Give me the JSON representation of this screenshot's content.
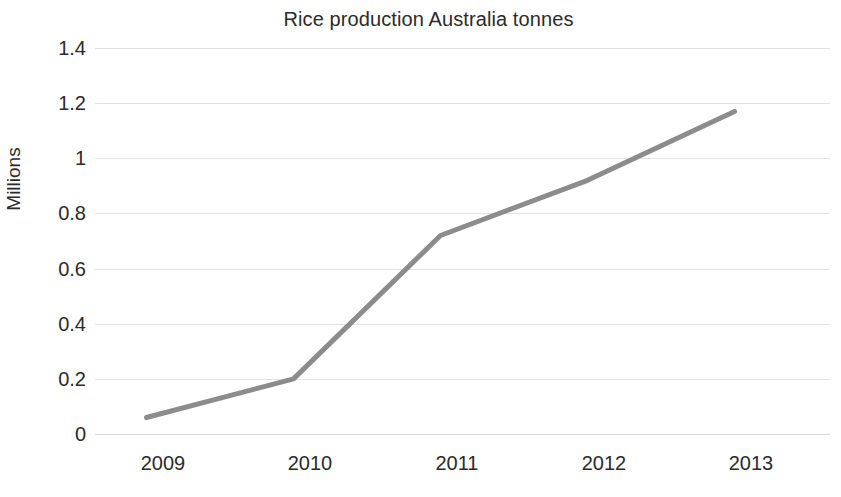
{
  "chart_data": {
    "type": "line",
    "title": "Rice production Australia tonnes",
    "xlabel": "",
    "ylabel": "Millions",
    "categories": [
      "2009",
      "2010",
      "2011",
      "2012",
      "2013"
    ],
    "x": [
      2009,
      2010,
      2011,
      2012,
      2013
    ],
    "series": [
      {
        "name": "Rice production Australia tonnes",
        "values": [
          0.06,
          0.2,
          0.72,
          0.92,
          1.17
        ],
        "color": "#8c8c8c"
      }
    ],
    "ylim": [
      0,
      1.4
    ],
    "y_ticks": [
      "0",
      "0.2",
      "0.4",
      "0.6",
      "0.8",
      "1",
      "1.2",
      "1.4"
    ],
    "y_tick_values": [
      0,
      0.2,
      0.4,
      0.6,
      0.8,
      1,
      1.2,
      1.4
    ],
    "x_ticks": [
      "2009",
      "2010",
      "2011",
      "2012",
      "2013"
    ],
    "grid": "horizontal",
    "grid_color": "#e2e2e6",
    "legend": "none",
    "background": "#ffffff",
    "line_width": 5
  }
}
